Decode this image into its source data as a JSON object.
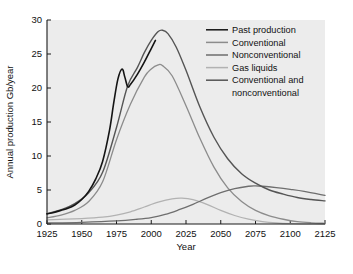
{
  "chart_data": {
    "type": "line",
    "title": "",
    "xlabel": "Year",
    "ylabel": "Annual production Gb/year",
    "xlim": [
      1925,
      2125
    ],
    "ylim": [
      0,
      30
    ],
    "xticks": [
      1925,
      1950,
      1975,
      2000,
      2025,
      2050,
      2075,
      2100,
      2125
    ],
    "yticks": [
      0,
      5,
      10,
      15,
      20,
      25,
      30
    ],
    "grid": false,
    "legend_position": "top-right",
    "plot_background": "#ececec",
    "x": [
      1925,
      1930,
      1935,
      1940,
      1945,
      1950,
      1955,
      1960,
      1965,
      1970,
      1975,
      1979,
      1983,
      1990,
      1995,
      2000,
      2005,
      2008,
      2010,
      2015,
      2020,
      2025,
      2030,
      2040,
      2050,
      2060,
      2070,
      2075,
      2080,
      2090,
      2100,
      2110,
      2125
    ],
    "series": [
      {
        "name": "Past production",
        "color": "#141414",
        "width": 1.6,
        "x": [
          1925,
          1930,
          1935,
          1940,
          1945,
          1950,
          1955,
          1960,
          1965,
          1970,
          1973,
          1976,
          1979,
          1981,
          1983,
          1985,
          1990,
          1995,
          2000,
          2003
        ],
        "values": [
          1.5,
          1.7,
          2.0,
          2.3,
          2.8,
          3.6,
          4.8,
          6.6,
          9.2,
          13.8,
          17.8,
          21.3,
          22.8,
          21.6,
          20.2,
          20.5,
          22.0,
          23.8,
          25.8,
          27.0
        ]
      },
      {
        "name": "Conventional",
        "color": "#8c8c8c",
        "width": 1.3,
        "x": [
          1925,
          1935,
          1945,
          1955,
          1965,
          1975,
          1985,
          1995,
          2000,
          2005,
          2008,
          2015,
          2025,
          2035,
          2045,
          2055,
          2065,
          2075,
          2085,
          2095,
          2105,
          2115,
          2125
        ],
        "values": [
          0.9,
          1.3,
          2.0,
          3.3,
          6.2,
          12.4,
          17.6,
          21.6,
          22.8,
          23.4,
          23.3,
          21.8,
          17.4,
          12.6,
          8.4,
          5.3,
          3.3,
          2.0,
          1.2,
          0.7,
          0.35,
          0.18,
          0.1
        ]
      },
      {
        "name": "Nonconventional",
        "color": "#6e6e6e",
        "width": 1.3,
        "x": [
          1925,
          1950,
          1975,
          1990,
          2000,
          2010,
          2020,
          2030,
          2040,
          2050,
          2060,
          2070,
          2075,
          2080,
          2090,
          2100,
          2110,
          2125
        ],
        "values": [
          0.15,
          0.25,
          0.45,
          0.7,
          0.95,
          1.4,
          2.1,
          2.9,
          3.8,
          4.6,
          5.2,
          5.55,
          5.6,
          5.55,
          5.35,
          5.1,
          4.8,
          4.2
        ]
      },
      {
        "name": "Gas liquids",
        "color": "#b2b2b2",
        "width": 1.3,
        "x": [
          1925,
          1950,
          1965,
          1975,
          1985,
          1995,
          2005,
          2015,
          2022,
          2030,
          2040,
          2050,
          2060,
          2070,
          2080,
          2090,
          2100,
          2110,
          2125
        ],
        "values": [
          0.6,
          0.8,
          1.0,
          1.3,
          1.8,
          2.5,
          3.2,
          3.7,
          3.8,
          3.6,
          2.9,
          2.0,
          1.25,
          0.7,
          0.35,
          0.15,
          0.05,
          0.02,
          0.0
        ]
      },
      {
        "name": "Conventional and nonconventional",
        "color": "#555555",
        "width": 1.4,
        "x": [
          1925,
          1935,
          1945,
          1955,
          1965,
          1975,
          1983,
          1990,
          1995,
          2000,
          2005,
          2008,
          2012,
          2018,
          2025,
          2035,
          2045,
          2055,
          2065,
          2075,
          2085,
          2095,
          2105,
          2115,
          2125
        ],
        "values": [
          1.5,
          2.1,
          3.0,
          4.6,
          7.6,
          14.2,
          20.3,
          23.0,
          25.2,
          27.0,
          28.3,
          28.5,
          28.0,
          26.0,
          22.6,
          17.2,
          12.8,
          9.6,
          7.4,
          6.0,
          5.0,
          4.4,
          3.9,
          3.6,
          3.4
        ]
      }
    ],
    "legend": [
      {
        "label": "Past production",
        "color": "#141414"
      },
      {
        "label": "Conventional",
        "color": "#8c8c8c"
      },
      {
        "label": "Nonconventional",
        "color": "#6e6e6e"
      },
      {
        "label": "Gas liquids",
        "color": "#b2b2b2"
      },
      {
        "label": "Conventional and",
        "color": "#555555"
      },
      {
        "label": "nonconventional",
        "color": null
      }
    ]
  }
}
